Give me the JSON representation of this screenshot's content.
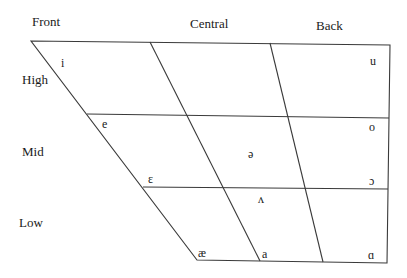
{
  "columns": [
    {
      "label": "Front",
      "x": 32,
      "y": 26
    },
    {
      "label": "Central",
      "x": 190,
      "y": 28
    },
    {
      "label": "Back",
      "x": 316,
      "y": 30
    }
  ],
  "rows": [
    {
      "label": "High",
      "x": 22,
      "y": 84
    },
    {
      "label": "Mid",
      "x": 22,
      "y": 156
    },
    {
      "label": "Low",
      "x": 19,
      "y": 227
    }
  ],
  "vowels": [
    {
      "symbol": "i",
      "x": 61,
      "y": 67,
      "position": "high-front"
    },
    {
      "symbol": "u",
      "x": 370,
      "y": 65,
      "position": "high-back"
    },
    {
      "symbol": "e",
      "x": 102,
      "y": 128,
      "position": "mid-front"
    },
    {
      "symbol": "o",
      "x": 369,
      "y": 131,
      "position": "mid-back"
    },
    {
      "symbol": "ə",
      "x": 248,
      "y": 158,
      "position": "mid-central"
    },
    {
      "symbol": "ɛ",
      "x": 148,
      "y": 183,
      "position": "low-mid-front"
    },
    {
      "symbol": "ɔ",
      "x": 369,
      "y": 185,
      "position": "low-mid-back"
    },
    {
      "symbol": "ʌ",
      "x": 258,
      "y": 203,
      "position": "low-mid-central"
    },
    {
      "symbol": "æ",
      "x": 198,
      "y": 257,
      "position": "low-front"
    },
    {
      "symbol": "a",
      "x": 262,
      "y": 258,
      "position": "low-central"
    },
    {
      "symbol": "ɑ",
      "x": 368,
      "y": 259,
      "position": "low-back"
    }
  ],
  "colors": {
    "line": "#3a3a3a",
    "text": "#1a1a1a",
    "background": "#ffffff"
  }
}
